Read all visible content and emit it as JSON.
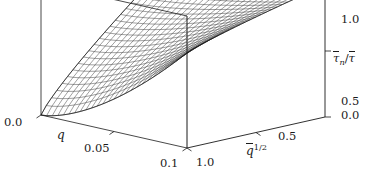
{
  "figure": {
    "type": "3d-surface-plot",
    "background": "#ffffff",
    "line_color": "#1a1a1a",
    "mesh_color": "#2b2b2b"
  },
  "axes": {
    "x": {
      "name": "q",
      "label_parts": {
        "symbol": "q",
        "overbar": false,
        "superscript": ""
      },
      "ticks": [
        "0.0",
        "0.05",
        "0.1"
      ],
      "tick_values": [
        0.0,
        0.05,
        0.1
      ],
      "range": [
        0.0,
        0.1
      ]
    },
    "y": {
      "name": "qbar^1/2",
      "label_parts": {
        "symbol": "q",
        "overbar": true,
        "superscript": "1/2"
      },
      "ticks": [
        "1.0",
        "0.5"
      ],
      "tick_values": [
        1.0,
        0.5
      ],
      "range": [
        0.0,
        1.0
      ]
    },
    "z": {
      "name": "tau_n_bar / tau_bar",
      "label_parts": {
        "numerator": "τ",
        "numerator_sub": "n",
        "denominator": "τ",
        "overbar": true
      },
      "ticks": [
        "1.0",
        "0.5",
        "0.0"
      ],
      "tick_values": [
        1.0,
        0.5,
        0.0
      ],
      "range": [
        0.0,
        1.0
      ]
    }
  },
  "chart_data": {
    "type": "surface",
    "title": "",
    "xlabel": "q",
    "ylabel": "q̄^1/2",
    "zlabel": "τ̄ₙ/τ̄",
    "xlim": [
      0.0,
      0.1
    ],
    "ylim": [
      0.0,
      1.0
    ],
    "zlim": [
      0.0,
      1.0
    ],
    "xticks": [
      0.0,
      0.05,
      0.1
    ],
    "yticks": [
      1.0,
      0.5
    ],
    "zticks": [
      0.0,
      0.5,
      1.0
    ],
    "xticklabels": [
      "0.0",
      "0.05",
      "0.1"
    ],
    "yticklabels": [
      "1.0",
      "0.5"
    ],
    "zticklabels": [
      "0.0",
      "0.5",
      "1.0"
    ],
    "grid": false,
    "legend": null,
    "mesh_nx": 26,
    "mesh_ny": 26,
    "corner_values": {
      "x0_y1": 0.0,
      "x1_y1": 0.62,
      "x0_y0": 0.88,
      "x1_y0": 1.0
    },
    "z_samples": [
      [
        0.88,
        0.92,
        0.96,
        1.0
      ],
      [
        0.55,
        0.66,
        0.79,
        0.92
      ],
      [
        0.28,
        0.4,
        0.57,
        0.77
      ],
      [
        0.0,
        0.16,
        0.37,
        0.62
      ]
    ],
    "z_sample_x": [
      0.0,
      0.0333,
      0.0667,
      0.1
    ],
    "z_sample_y": [
      0.0,
      0.3333,
      0.6667,
      1.0
    ]
  },
  "view": {
    "azimuth_label": "front-left",
    "box": "open-wireframe"
  }
}
